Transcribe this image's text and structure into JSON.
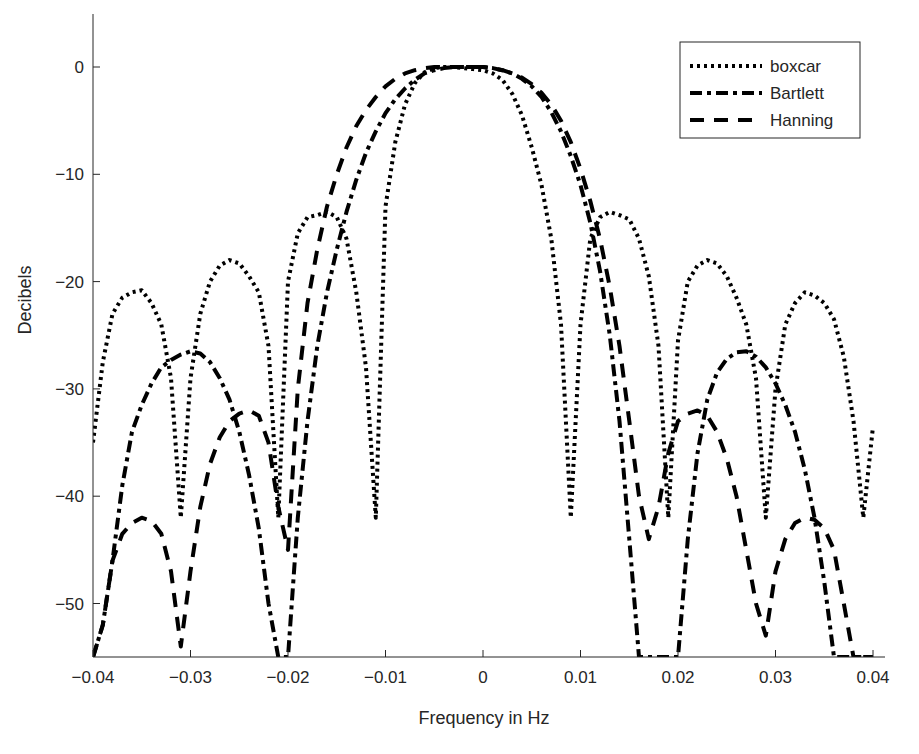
{
  "chart_data": {
    "type": "line",
    "title": "",
    "xlabel": "Frequency in Hz",
    "ylabel": "Decibels",
    "xlim": [
      -0.04,
      0.04
    ],
    "ylim": [
      -55,
      5
    ],
    "xticks": [
      -0.04,
      -0.03,
      -0.02,
      -0.01,
      0,
      0.01,
      0.02,
      0.03,
      0.04
    ],
    "xtick_labels": [
      "−0.04",
      "−0.03",
      "−0.02",
      "−0.01",
      "0",
      "0.01",
      "0.02",
      "0.03",
      "0.04"
    ],
    "yticks": [
      0,
      -10,
      -20,
      -30,
      -40,
      -50
    ],
    "ytick_labels": [
      "0",
      "−10",
      "−20",
      "−30",
      "−40",
      "−50"
    ],
    "grid": false,
    "legend_position": "upper right",
    "x": [
      -0.04,
      -0.039,
      -0.038,
      -0.037,
      -0.036,
      -0.035,
      -0.034,
      -0.033,
      -0.032,
      -0.031,
      -0.03,
      -0.029,
      -0.028,
      -0.027,
      -0.026,
      -0.025,
      -0.024,
      -0.023,
      -0.022,
      -0.021,
      -0.02,
      -0.019,
      -0.018,
      -0.017,
      -0.016,
      -0.015,
      -0.014,
      -0.013,
      -0.012,
      -0.011,
      -0.01,
      -0.009,
      -0.008,
      -0.007,
      -0.006,
      -0.005,
      -0.004,
      -0.003,
      -0.002,
      -0.001,
      0.0,
      0.001,
      0.002,
      0.003,
      0.004,
      0.005,
      0.006,
      0.007,
      0.008,
      0.009,
      0.01,
      0.011,
      0.012,
      0.013,
      0.014,
      0.015,
      0.016,
      0.017,
      0.018,
      0.019,
      0.02,
      0.021,
      0.022,
      0.023,
      0.024,
      0.025,
      0.026,
      0.027,
      0.028,
      0.029,
      0.03,
      0.031,
      0.032,
      0.033,
      0.034,
      0.035,
      0.036,
      0.037,
      0.038,
      0.039,
      0.04
    ],
    "series": [
      {
        "name": "boxcar",
        "style": "dotted",
        "values": [
          -35,
          -27.5,
          -23,
          -21.5,
          -21,
          -20.8,
          -22,
          -24,
          -29,
          -42,
          -29,
          -23,
          -20,
          -18.5,
          -18,
          -18.3,
          -19.5,
          -21,
          -26,
          -42,
          -20,
          -15.5,
          -14,
          -13.8,
          -13.5,
          -14,
          -16,
          -21,
          -28,
          -42,
          -13,
          -7,
          -3.5,
          -1.5,
          -0.5,
          -0.1,
          0,
          0,
          -0.1,
          -0.2,
          -0.3,
          -0.6,
          -1.2,
          -2.5,
          -4.5,
          -7.5,
          -11,
          -16,
          -24,
          -42,
          -24,
          -16,
          -14,
          -13.5,
          -13.8,
          -14.2,
          -16,
          -19.5,
          -26,
          -42,
          -25.5,
          -20,
          -18.5,
          -18,
          -18.3,
          -19.5,
          -21.5,
          -24,
          -29,
          -42,
          -30,
          -24,
          -22,
          -21,
          -21.3,
          -22,
          -23.5,
          -27,
          -33,
          -42,
          -33.5
        ]
      },
      {
        "name": "Bartlett",
        "style": "dash-dot",
        "values": [
          -55,
          -52,
          -46,
          -39,
          -34,
          -31.5,
          -29.5,
          -28,
          -27.3,
          -26.8,
          -26.5,
          -26.7,
          -27.5,
          -29,
          -31,
          -34,
          -38,
          -43,
          -50,
          -55,
          -55,
          -42,
          -33,
          -26,
          -21,
          -17,
          -13.5,
          -10.5,
          -8,
          -6,
          -4.3,
          -3,
          -2,
          -1.2,
          -0.6,
          -0.3,
          -0.1,
          0,
          0,
          0,
          0,
          -0.1,
          -0.3,
          -0.6,
          -1.1,
          -1.8,
          -2.8,
          -4.2,
          -6,
          -8.3,
          -11,
          -14.5,
          -19,
          -25,
          -33,
          -44,
          -55,
          -55,
          -55,
          -55,
          -55,
          -44,
          -36,
          -31,
          -28.5,
          -27.2,
          -26.6,
          -26.5,
          -27,
          -28,
          -29.5,
          -31.5,
          -34,
          -37.5,
          -42,
          -48,
          -55,
          -55,
          -55,
          -55,
          -55
        ]
      },
      {
        "name": "Hanning",
        "style": "dashed",
        "values": [
          -55,
          -52,
          -46,
          -43.5,
          -42.5,
          -42,
          -42.3,
          -43.5,
          -47,
          -54,
          -47,
          -41,
          -37,
          -34.5,
          -33,
          -32.3,
          -32,
          -32.5,
          -35,
          -41,
          -45,
          -30,
          -22,
          -17,
          -13,
          -10,
          -7.5,
          -5.5,
          -4,
          -2.8,
          -1.8,
          -1.1,
          -0.6,
          -0.3,
          -0.1,
          0,
          0,
          0,
          0,
          0,
          0,
          -0.1,
          -0.3,
          -0.6,
          -1,
          -1.6,
          -2.4,
          -3.5,
          -5,
          -7,
          -9.5,
          -12.5,
          -16,
          -20.5,
          -26,
          -33,
          -40,
          -44,
          -41,
          -36,
          -33,
          -32.3,
          -32,
          -32.5,
          -34,
          -36.5,
          -40,
          -45,
          -50,
          -53,
          -47,
          -44,
          -42.5,
          -42,
          -42.2,
          -43,
          -45,
          -50,
          -55,
          -55,
          -55
        ]
      }
    ]
  },
  "legend": {
    "items": [
      {
        "label": "boxcar",
        "style": "dotted"
      },
      {
        "label": "Bartlett",
        "style": "dash-dot"
      },
      {
        "label": "Hanning",
        "style": "dashed"
      }
    ]
  },
  "colors": {
    "line": "#000000",
    "axis": "#262626",
    "background": "#ffffff"
  }
}
